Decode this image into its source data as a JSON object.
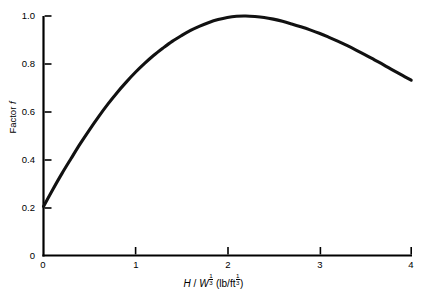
{
  "figure": {
    "title_remnant": "",
    "background": "#ffffff",
    "line_color": "#111111",
    "axis_color": "#000000"
  },
  "axes": {
    "y": {
      "label_prefix": "Factor ",
      "label_symbol": "f",
      "ticks": [
        "0",
        "0.2",
        "0.4",
        "0.6",
        "0.8",
        "1.0"
      ],
      "tick_values": [
        0,
        0.2,
        0.4,
        0.6,
        0.8,
        1.0
      ],
      "range": [
        0,
        1.0
      ]
    },
    "x": {
      "label_numerator": "H",
      "label_slash": " / ",
      "label_denominator": "W",
      "label_exponent_num": "1",
      "label_exponent_den": "3",
      "label_units_open": " (lb/ft",
      "label_units_exponent_num": "1",
      "label_units_exponent_den": "3",
      "label_units_close": ")",
      "ticks": [
        "0",
        "1",
        "2",
        "3",
        "4"
      ],
      "tick_values": [
        0,
        1,
        2,
        3,
        4
      ],
      "range": [
        0,
        4
      ]
    }
  },
  "chart_data": {
    "type": "line",
    "title": "",
    "xlabel": "H / W^(1/3)  (lb/ft^(1/3))",
    "ylabel": "Factor f",
    "xlim": [
      0,
      4
    ],
    "ylim": [
      0,
      1.0
    ],
    "grid": false,
    "legend": null,
    "series": [
      {
        "name": "Factor f",
        "x": [
          0.0,
          0.1,
          0.2,
          0.3,
          0.4,
          0.5,
          0.6,
          0.7,
          0.8,
          0.9,
          1.0,
          1.1,
          1.2,
          1.3,
          1.4,
          1.5,
          1.6,
          1.7,
          1.8,
          1.9,
          2.0,
          2.1,
          2.2,
          2.3,
          2.4,
          2.5,
          2.6,
          2.7,
          2.8,
          2.9,
          3.0,
          3.1,
          3.2,
          3.3,
          3.4,
          3.5,
          3.6,
          3.7,
          3.8,
          3.9,
          4.0
        ],
        "y": [
          0.205,
          0.275,
          0.342,
          0.405,
          0.467,
          0.525,
          0.58,
          0.632,
          0.68,
          0.724,
          0.765,
          0.802,
          0.836,
          0.866,
          0.894,
          0.918,
          0.94,
          0.958,
          0.973,
          0.985,
          0.994,
          0.999,
          1.0,
          0.998,
          0.994,
          0.987,
          0.978,
          0.967,
          0.955,
          0.942,
          0.928,
          0.912,
          0.895,
          0.877,
          0.858,
          0.838,
          0.817,
          0.796,
          0.774,
          0.753,
          0.732
        ]
      }
    ],
    "annotations": {
      "peak_x": 2.2,
      "peak_y": 1.0,
      "start_y": 0.205,
      "end_y": 0.732
    }
  }
}
